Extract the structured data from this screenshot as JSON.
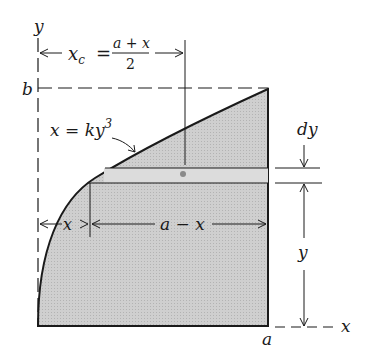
{
  "figure": {
    "colors": {
      "fill": "#c9c9c9",
      "line": "#1a1a1a",
      "strip": "#d8d8d8",
      "centroid_dot": "#8a8a8a"
    }
  },
  "labels": {
    "y_axis": "y",
    "x_axis": "x",
    "b": "b",
    "a": "a",
    "xc_lhs": "x",
    "xc_sub": "c",
    "xc_eq": "=",
    "xc_num": "a + x",
    "xc_den": "2",
    "curve_lhs": "x = ky",
    "curve_exp": "3",
    "dy": "dy",
    "x_dim": "x",
    "a_minus_x": "a − x",
    "y_dim": "y"
  }
}
